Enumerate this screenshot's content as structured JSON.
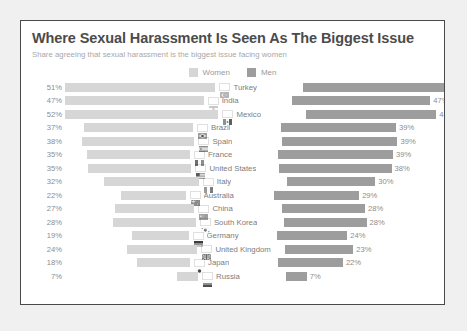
{
  "chart_data": {
    "type": "bar",
    "title": "Where Sexual Harassment Is Seen As The Biggest Issue",
    "subtitle": "Share agreeing that sexual harassment is the biggest issue facing women",
    "xlabel": "",
    "ylabel": "",
    "orientation": "horizontal-diverging",
    "grid": false,
    "legend_position": "top-center",
    "value_suffix": "%",
    "xlim": [
      0,
      55
    ],
    "categories": [
      "Turkey",
      "India",
      "Mexico",
      "Brazil",
      "Spain",
      "France",
      "United States",
      "Italy",
      "Australia",
      "China",
      "South Korea",
      "Germany",
      "United Kingdom",
      "Japan",
      "Russia"
    ],
    "series": [
      {
        "name": "Women",
        "color": "#d6d6d6",
        "values": [
          51,
          47,
          52,
          37,
          38,
          35,
          35,
          32,
          22,
          27,
          28,
          19,
          24,
          18,
          7
        ]
      },
      {
        "name": "Men",
        "color": "#9d9d9d",
        "values": [
          50,
          47,
          44,
          39,
          39,
          39,
          38,
          30,
          29,
          28,
          28,
          24,
          23,
          22,
          7
        ]
      }
    ],
    "rows": [
      {
        "country": "Turkey",
        "flag": "flag-turkey",
        "women": 51,
        "men": 50,
        "women_label": "51%",
        "men_label": "50%"
      },
      {
        "country": "India",
        "flag": "flag-india",
        "women": 47,
        "men": 47,
        "women_label": "47%",
        "men_label": "47%"
      },
      {
        "country": "Mexico",
        "flag": "flag-mexico",
        "women": 52,
        "men": 44,
        "women_label": "52%",
        "men_label": "44%"
      },
      {
        "country": "Brazil",
        "flag": "flag-brazil",
        "women": 37,
        "men": 39,
        "women_label": "37%",
        "men_label": "39%"
      },
      {
        "country": "Spain",
        "flag": "flag-spain",
        "women": 38,
        "men": 39,
        "women_label": "38%",
        "men_label": "39%"
      },
      {
        "country": "France",
        "flag": "flag-france",
        "women": 35,
        "men": 39,
        "women_label": "35%",
        "men_label": "39%"
      },
      {
        "country": "United States",
        "flag": "flag-united-states",
        "women": 35,
        "men": 38,
        "women_label": "35%",
        "men_label": "38%"
      },
      {
        "country": "Italy",
        "flag": "flag-italy",
        "women": 32,
        "men": 30,
        "women_label": "32%",
        "men_label": "30%"
      },
      {
        "country": "Australia",
        "flag": "flag-australia",
        "women": 22,
        "men": 29,
        "women_label": "22%",
        "men_label": "29%"
      },
      {
        "country": "China",
        "flag": "flag-china",
        "women": 27,
        "men": 28,
        "women_label": "27%",
        "men_label": "28%"
      },
      {
        "country": "South Korea",
        "flag": "flag-south-korea",
        "women": 28,
        "men": 28,
        "women_label": "28%",
        "men_label": "28%"
      },
      {
        "country": "Germany",
        "flag": "flag-germany",
        "women": 19,
        "men": 24,
        "women_label": "19%",
        "men_label": "24%"
      },
      {
        "country": "United Kingdom",
        "flag": "flag-united-kingdom",
        "women": 24,
        "men": 23,
        "women_label": "24%",
        "men_label": "23%"
      },
      {
        "country": "Japan",
        "flag": "flag-japan",
        "women": 18,
        "men": 22,
        "women_label": "18%",
        "men_label": "22%"
      },
      {
        "country": "Russia",
        "flag": "flag-russia",
        "women": 7,
        "men": 7,
        "women_label": "7%",
        "men_label": "7%"
      }
    ]
  },
  "legend": [
    {
      "label": "Women",
      "color": "#d6d6d6",
      "swatch_name": "legend-swatch-women"
    },
    {
      "label": "Men",
      "color": "#9d9d9d",
      "swatch_name": "legend-swatch-men"
    }
  ],
  "colors": {
    "women_bar": "#d6d6d6",
    "men_bar": "#9d9d9d",
    "title_text": "#4b4b4b",
    "subtitle_text": "#a8a8a8",
    "value_text": "#8d8d8d",
    "country_text": "#7d7d7d",
    "card_background": "#ffffff",
    "page_background": "#f0f0f0",
    "card_border": "#4a4a4a"
  }
}
